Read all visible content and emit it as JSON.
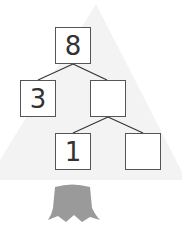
{
  "diagram": {
    "type": "number-bond-tree",
    "nodes": [
      {
        "id": "top",
        "value": "8"
      },
      {
        "id": "left",
        "value": "3"
      },
      {
        "id": "mid",
        "value": ""
      },
      {
        "id": "bottom-left",
        "value": "1"
      },
      {
        "id": "bottom-right",
        "value": ""
      }
    ],
    "edges": [
      [
        "top",
        "left"
      ],
      [
        "top",
        "mid"
      ],
      [
        "mid",
        "bottom-left"
      ],
      [
        "mid",
        "bottom-right"
      ]
    ],
    "colors": {
      "tree_fill": "#f3f3f3",
      "trunk_fill": "#9a9a9a",
      "box_border": "#555555",
      "line": "#333333"
    }
  }
}
